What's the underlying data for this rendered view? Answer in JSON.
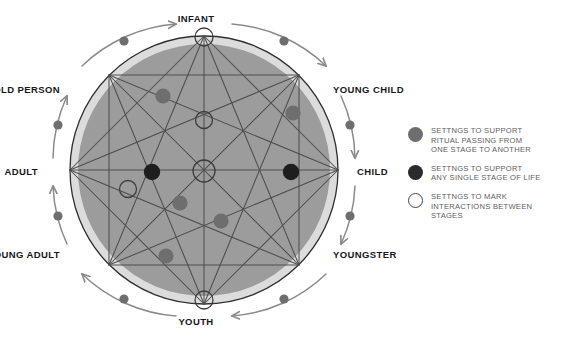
{
  "diagram": {
    "colors": {
      "outer_ring": "#dcdcdc",
      "inner_disc": "#9c9c9c",
      "circle_stroke": "#2f2f2f",
      "chord_stroke": "#5a5a5a",
      "node_gray": "#6e6e6e",
      "node_black": "#1e1e1e",
      "node_hollow_stroke": "#4a4a4a",
      "arrow": "#8a8a8a",
      "label_text": "#17181a",
      "legend_text": "#5d5d5d"
    },
    "stages": [
      {
        "id": "infant",
        "label": "INFANT",
        "angle_deg": 90,
        "label_x": 196,
        "label_y": 14,
        "align": "center"
      },
      {
        "id": "young-child",
        "label": "YOUNG CHILD",
        "angle_deg": 45,
        "label_x": 333,
        "label_y": 85,
        "align": "left"
      },
      {
        "id": "child",
        "label": "CHILD",
        "angle_deg": 0,
        "label_x": 357,
        "label_y": 167,
        "align": "left"
      },
      {
        "id": "youngster",
        "label": "YOUNGSTER",
        "angle_deg": -45,
        "label_x": 333,
        "label_y": 250,
        "align": "left"
      },
      {
        "id": "youth",
        "label": "YOUTH",
        "angle_deg": -90,
        "label_x": 196,
        "label_y": 317,
        "align": "center"
      },
      {
        "id": "young-adult",
        "label": "YOUNG ADULT",
        "angle_deg": -135,
        "label_x": 60,
        "label_y": 250,
        "align": "right"
      },
      {
        "id": "adult",
        "label": "ADULT",
        "angle_deg": 180,
        "label_x": 38,
        "label_y": 167,
        "align": "right"
      },
      {
        "id": "old-person",
        "label": "OLD PERSON",
        "angle_deg": 135,
        "label_x": 60,
        "label_y": 85,
        "align": "right"
      }
    ],
    "transitions": [
      {
        "from": "infant",
        "to": "young-child",
        "marker": "gray-dot"
      },
      {
        "from": "young-child",
        "to": "child",
        "marker": "gray-dot"
      },
      {
        "from": "child",
        "to": "youngster",
        "marker": "gray-dot"
      },
      {
        "from": "youngster",
        "to": "youth",
        "marker": "gray-dot"
      },
      {
        "from": "youth",
        "to": "young-adult",
        "marker": "gray-dot"
      },
      {
        "from": "young-adult",
        "to": "adult",
        "marker": "gray-dot"
      },
      {
        "from": "adult",
        "to": "old-person",
        "marker": "gray-dot"
      },
      {
        "from": "old-person",
        "to": "infant",
        "marker": "gray-dot"
      }
    ],
    "interior_nodes": [
      {
        "id": "n-hollow-infant",
        "type": "hollow",
        "x": 204,
        "y": 41
      },
      {
        "id": "n-hollow-upper-mid",
        "type": "hollow",
        "x": 204,
        "y": 120
      },
      {
        "id": "n-hollow-center",
        "type": "hollow",
        "x": 204,
        "y": 171
      },
      {
        "id": "n-hollow-left",
        "type": "hollow",
        "x": 128,
        "y": 189
      },
      {
        "id": "n-hollow-youth",
        "type": "hollow",
        "x": 204,
        "y": 299
      },
      {
        "id": "n-gray-upper-left",
        "type": "gray",
        "x": 163,
        "y": 96
      },
      {
        "id": "n-gray-upper-right",
        "type": "gray",
        "x": 293,
        "y": 113
      },
      {
        "id": "n-gray-mid-left",
        "type": "gray",
        "x": 180,
        "y": 203
      },
      {
        "id": "n-gray-lower-center",
        "type": "gray",
        "x": 221,
        "y": 221
      },
      {
        "id": "n-gray-lower-left",
        "type": "gray",
        "x": 166,
        "y": 256
      },
      {
        "id": "n-black-left",
        "type": "black",
        "x": 152,
        "y": 172
      },
      {
        "id": "n-black-right",
        "type": "black",
        "x": 291,
        "y": 172
      }
    ]
  },
  "legend": {
    "items": [
      {
        "swatch": "gray-dot",
        "lines": [
          "SETTNGS TO SUPPORT",
          "RITUAL PASSING FROM",
          "ONE STAGE TO ANOTHER"
        ]
      },
      {
        "swatch": "black-dot",
        "lines": [
          "SETTNGS TO SUPPORT",
          "ANY SINGLE STAGE OF LIFE"
        ]
      },
      {
        "swatch": "hollow-circle",
        "lines": [
          "SETTNGS TO MARK",
          "INTERACTIONS BETWEEN",
          "STAGES"
        ]
      }
    ]
  }
}
